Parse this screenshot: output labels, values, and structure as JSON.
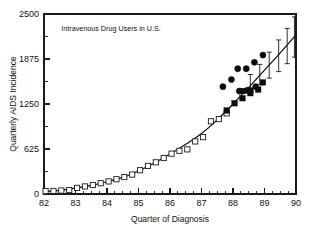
{
  "chart_data": {
    "type": "scatter",
    "title": "Intravenous Drug Users in U.S.",
    "xlabel": "Quarter of Diagnosis",
    "ylabel": "Quarterly AIDS Incidence",
    "xlim": [
      82,
      90
    ],
    "ylim": [
      0,
      2500
    ],
    "grid": false,
    "legend_position": "none",
    "x_ticks": [
      82,
      83,
      84,
      85,
      86,
      87,
      88,
      89,
      90
    ],
    "x_tick_labels": [
      "82",
      "83",
      "84",
      "85",
      "86",
      "87",
      "88",
      "89",
      "90"
    ],
    "x_minor_tick_step": 0.25,
    "y_ticks": [
      0,
      625,
      1250,
      1875,
      2500
    ],
    "y_tick_labels": [
      "0",
      "625",
      "1250",
      "1875",
      "2500"
    ],
    "y_minor_ticks": [
      312.5,
      937.5,
      1562.5,
      2187.5
    ],
    "series": [
      {
        "name": "Observed (open squares)",
        "marker": "open-square",
        "points": [
          [
            82.05,
            40
          ],
          [
            82.3,
            42
          ],
          [
            82.55,
            48
          ],
          [
            82.8,
            55
          ],
          [
            83.05,
            85
          ],
          [
            83.3,
            105
          ],
          [
            83.55,
            125
          ],
          [
            83.8,
            150
          ],
          [
            84.05,
            175
          ],
          [
            84.3,
            205
          ],
          [
            84.55,
            235
          ],
          [
            84.8,
            270
          ],
          [
            85.05,
            330
          ],
          [
            85.3,
            390
          ],
          [
            85.55,
            440
          ],
          [
            85.8,
            500
          ],
          [
            86.05,
            560
          ],
          [
            86.3,
            600
          ],
          [
            86.55,
            620
          ],
          [
            86.8,
            730
          ],
          [
            87.05,
            790
          ],
          [
            87.3,
            1010
          ],
          [
            87.55,
            1040
          ],
          [
            87.8,
            1120
          ]
        ]
      },
      {
        "name": "Adjusted (filled squares)",
        "marker": "filled-square",
        "points": [
          [
            87.8,
            1160
          ],
          [
            88.05,
            1260
          ],
          [
            88.3,
            1330
          ],
          [
            88.55,
            1440
          ],
          [
            88.8,
            1450
          ],
          [
            88.95,
            1550
          ],
          [
            88.3,
            1430
          ],
          [
            88.55,
            1400
          ]
        ]
      },
      {
        "name": "Reported (filled circles)",
        "marker": "filled-circle",
        "points": [
          [
            87.68,
            1490
          ],
          [
            87.95,
            1590
          ],
          [
            88.15,
            1740
          ],
          [
            88.42,
            1740
          ],
          [
            88.2,
            1430
          ],
          [
            88.45,
            1440
          ],
          [
            88.68,
            1830
          ],
          [
            88.72,
            1490
          ],
          [
            88.95,
            1930
          ]
        ]
      }
    ],
    "fit_curve": [
      [
        82.0,
        35
      ],
      [
        82.5,
        50
      ],
      [
        83.0,
        80
      ],
      [
        83.5,
        120
      ],
      [
        84.0,
        170
      ],
      [
        84.5,
        230
      ],
      [
        85.0,
        320
      ],
      [
        85.5,
        430
      ],
      [
        86.0,
        555
      ],
      [
        86.5,
        690
      ],
      [
        87.0,
        840
      ],
      [
        87.5,
        1030
      ],
      [
        88.0,
        1250
      ],
      [
        88.5,
        1480
      ],
      [
        89.0,
        1720
      ],
      [
        89.5,
        1960
      ],
      [
        90.0,
        2210
      ]
    ],
    "error_bars": [
      {
        "x": 88.55,
        "y": 1560,
        "low": 1460,
        "high": 1660
      },
      {
        "x": 88.85,
        "y": 1660,
        "low": 1520,
        "high": 1800
      },
      {
        "x": 89.15,
        "y": 1790,
        "low": 1610,
        "high": 1970
      },
      {
        "x": 89.45,
        "y": 1930,
        "low": 1700,
        "high": 2140
      },
      {
        "x": 89.72,
        "y": 2070,
        "low": 1810,
        "high": 2300
      },
      {
        "x": 89.95,
        "y": 2215,
        "low": 1900,
        "high": 2460
      }
    ]
  }
}
